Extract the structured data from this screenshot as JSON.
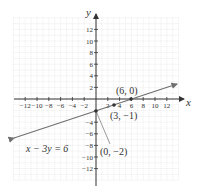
{
  "chart_data": {
    "type": "line",
    "title": "",
    "xlabel": "x",
    "ylabel": "y",
    "xlim": [
      -14,
      14
    ],
    "ylim": [
      -14,
      14
    ],
    "grid": true,
    "x_ticks": [
      -12,
      -10,
      -8,
      -6,
      -4,
      -2,
      2,
      4,
      6,
      8,
      10,
      12
    ],
    "y_ticks": [
      -12,
      -10,
      -8,
      -6,
      -4,
      -2,
      2,
      4,
      6,
      8,
      10,
      12
    ],
    "x_tick_labels": [
      "−12",
      "−10",
      "−8",
      "−6",
      "−4",
      "−2",
      "2",
      "4",
      "6",
      "8",
      "10",
      "12"
    ],
    "y_tick_labels": [
      "−12",
      "−10",
      "−8",
      "−6",
      "−4",
      "−2",
      "2",
      "4",
      "6",
      "8",
      "10",
      "12"
    ],
    "series": [
      {
        "name": "x − 3y = 6",
        "equation": "x - 3y = 6",
        "slope": 0.3333,
        "intercept": -2,
        "x": [
          -14,
          14
        ],
        "y": [
          -6.667,
          2.667
        ],
        "color": "#6f6f6f",
        "arrows": "both"
      }
    ],
    "points": [
      {
        "x": 6,
        "y": 0,
        "label": "(6, 0)"
      },
      {
        "x": 3,
        "y": -1,
        "label": "(3, −1)"
      },
      {
        "x": 0,
        "y": -2,
        "label": "(0, −2)"
      }
    ],
    "annotations": [
      {
        "text": "x − 3y = 6",
        "target": "line"
      },
      {
        "text": "(0, −2)",
        "target": "point",
        "leader_line": true
      }
    ]
  },
  "labels": {
    "x_axis": "x",
    "y_axis": "y",
    "equation": "x − 3y = 6",
    "p1": "(6, 0)",
    "p2": "(3, −1)",
    "p3": "(0, −2)"
  },
  "colors": {
    "axis": "#333333",
    "grid": "#d8d8d8",
    "line": "#6f6f6f",
    "point": "#333333"
  }
}
